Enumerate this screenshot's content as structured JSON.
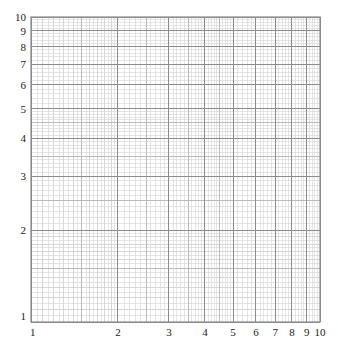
{
  "chart_data": {
    "type": "scatter",
    "title": "",
    "xlabel": "",
    "ylabel": "",
    "xscale": "log",
    "yscale": "log",
    "xlim": [
      1,
      10
    ],
    "ylim": [
      1,
      10
    ],
    "grid": true,
    "series": [],
    "x_tick_labels": [
      "1",
      "2",
      "3",
      "4",
      "5",
      "6",
      "7",
      "8",
      "9",
      "10"
    ],
    "y_tick_labels": [
      "1",
      "2",
      "3",
      "4",
      "5",
      "6",
      "7",
      "8",
      "9",
      "10"
    ],
    "x_ticks": [
      1,
      2,
      3,
      4,
      5,
      6,
      7,
      8,
      9,
      10
    ],
    "y_ticks": [
      1,
      2,
      3,
      4,
      5,
      6,
      7,
      8,
      9,
      10
    ],
    "minor_subdivisions": [
      {
        "from": 1,
        "to": 2,
        "step": 0.05
      },
      {
        "from": 2,
        "to": 5,
        "step": 0.1
      },
      {
        "from": 5,
        "to": 10,
        "step": 0.2
      }
    ]
  },
  "plot_area": {
    "left": 31,
    "top": 17,
    "right": 320,
    "bottom": 322
  },
  "colors": {
    "minor_line": "#d4d4d4",
    "mid_line": "#b4b4b4",
    "major_line": "#8c8c8c",
    "border": "#8a8a8a",
    "text": "#222222"
  }
}
